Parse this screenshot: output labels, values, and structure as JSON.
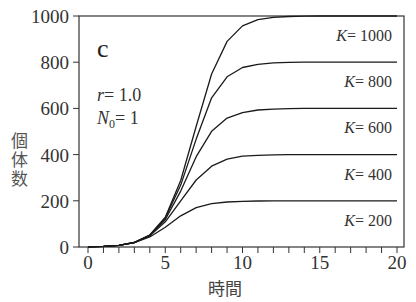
{
  "chart_data": {
    "type": "line",
    "title": "",
    "panel_label": "c",
    "annotations": [
      "r = 1.0",
      "N0 = 1"
    ],
    "params": {
      "r": 1.0,
      "N0": 1
    },
    "xlabel": "時間",
    "ylabel": "個体数",
    "xlim": [
      -0.6,
      20.5
    ],
    "ylim": [
      0,
      1000
    ],
    "xticks": [
      0,
      5,
      10,
      15,
      20
    ],
    "xminor_step": 1,
    "yticks": [
      0,
      200,
      400,
      600,
      800,
      1000
    ],
    "grid": false,
    "legend_position": "inline-right",
    "x": [
      0,
      1,
      2,
      3,
      4,
      5,
      6,
      7,
      8,
      9,
      10,
      11,
      12,
      13,
      14,
      15,
      16,
      17,
      18,
      19,
      20
    ],
    "series": [
      {
        "name": "K = 1000",
        "K": 1000,
        "values": [
          1,
          2.7,
          7.3,
          19.7,
          51.8,
          129,
          288,
          523,
          749,
          890,
          957,
          984,
          994,
          998,
          999,
          1000,
          1000,
          1000,
          1000,
          1000,
          1000
        ]
      },
      {
        "name": "K = 800",
        "K": 800,
        "values": [
          1,
          2.7,
          7.3,
          19.6,
          51.0,
          125,
          268,
          467,
          646,
          737,
          777,
          791,
          797,
          799,
          800,
          800,
          800,
          800,
          800,
          800,
          800
        ]
      },
      {
        "name": "K = 600",
        "K": 600,
        "values": [
          1,
          2.7,
          7.3,
          19.5,
          50.0,
          119,
          242,
          391,
          501,
          558,
          582,
          593,
          597,
          599,
          600,
          600,
          600,
          600,
          600,
          600,
          600
        ]
      },
      {
        "name": "K = 400",
        "K": 400,
        "values": [
          1,
          2.7,
          7.3,
          19.2,
          48.3,
          109,
          200,
          290,
          350,
          380,
          393,
          397,
          399,
          400,
          400,
          400,
          400,
          400,
          400,
          400,
          400
        ]
      },
      {
        "name": "K = 200",
        "K": 200,
        "values": [
          1,
          2.7,
          7.1,
          18.4,
          43.2,
          85.8,
          135,
          170,
          188,
          195,
          198,
          199,
          200,
          200,
          200,
          200,
          200,
          200,
          200,
          200,
          200
        ]
      }
    ]
  },
  "labels": {
    "panel": "c",
    "r_var": "r",
    "r_val": "= 1.0",
    "n_var": "N",
    "n_sub": "0",
    "n_val": "= 1",
    "ylabel_chars": [
      "個",
      "体",
      "数"
    ],
    "xlabel": "時間",
    "k_var": "K",
    "k_texts": [
      "= 1000",
      "= 800",
      "= 600",
      "= 400",
      "= 200"
    ]
  }
}
